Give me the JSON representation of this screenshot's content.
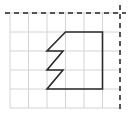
{
  "diagram": {
    "type": "grid-shape-with-mirror-axes",
    "width": 131,
    "height": 113,
    "colors": {
      "background": "#ffffff",
      "grid": "#d4d4d4",
      "shape": "#2a2a2a",
      "axis": "#555555"
    },
    "grid": {
      "x_lines": [
        10,
        28.5,
        47,
        65.5,
        84,
        102.5
      ],
      "y_lines": [
        13,
        32,
        51,
        70,
        89,
        108
      ],
      "x_min": 10,
      "x_max": 120,
      "y_min": 13,
      "y_max": 108
    },
    "axes": {
      "horizontal_dashed": {
        "x1": 5,
        "y1": 13,
        "x2": 126,
        "y2": 13
      },
      "vertical_dashed": {
        "x1": 120,
        "y1": 5,
        "x2": 120,
        "y2": 110
      }
    },
    "shape": {
      "description": "polygon with zigzag left edge",
      "points": [
        [
          65.5,
          32
        ],
        [
          102.5,
          32
        ],
        [
          102.5,
          89
        ],
        [
          47,
          89
        ],
        [
          63,
          70
        ],
        [
          47,
          70
        ],
        [
          63,
          51
        ],
        [
          47,
          51
        ]
      ]
    }
  }
}
